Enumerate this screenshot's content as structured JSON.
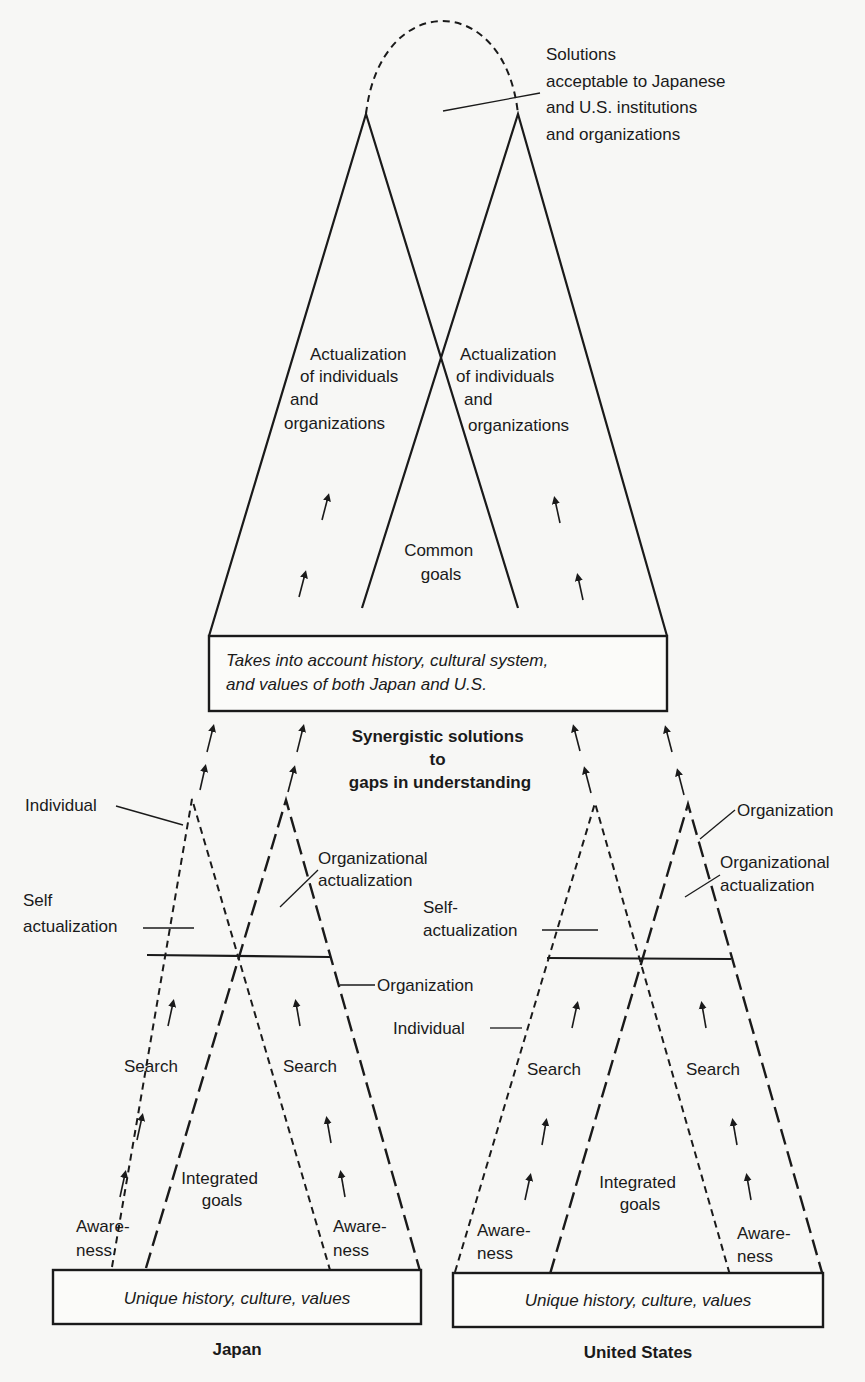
{
  "top": {
    "solutions_label": [
      "Solutions",
      "acceptable to Japanese",
      "and U.S. institutions",
      "and organizations"
    ],
    "left_actualization": [
      "Actualization",
      "of individuals",
      "and",
      "organizations"
    ],
    "right_actualization": [
      "Actualization",
      "of individuals",
      "and",
      "organizations"
    ],
    "common_goals": [
      "Common",
      "goals"
    ],
    "box_text": [
      "Takes into account history, cultural system,",
      "and values of both Japan and U.S."
    ]
  },
  "middle": {
    "synergy_label": [
      "Synergistic solutions",
      "to",
      "gaps in understanding"
    ]
  },
  "japan": {
    "individual_label": "Individual",
    "self_actualization": [
      "Self",
      "actualization"
    ],
    "org_actualization": [
      "Organizational",
      "actualization"
    ],
    "organization_label": "Organization",
    "search_left": "Search",
    "search_right": "Search",
    "integrated_goals": [
      "Integrated",
      "goals"
    ],
    "awareness_left": [
      "Aware-",
      "ness"
    ],
    "awareness_right": [
      "Aware-",
      "ness"
    ],
    "box_text": "Unique history, culture, values",
    "caption": "Japan"
  },
  "us": {
    "organization_label": "Organization",
    "org_actualization": [
      "Organizational",
      "actualization"
    ],
    "self_actualization": [
      "Self-",
      "actualization"
    ],
    "individual_label": "Individual",
    "search_left": "Search",
    "search_right": "Search",
    "integrated_goals": [
      "Integrated",
      "goals"
    ],
    "awareness_left": [
      "Aware-",
      "ness"
    ],
    "awareness_right": [
      "Aware-",
      "ness"
    ],
    "box_text": "Unique history, culture, values",
    "caption": "United States"
  }
}
